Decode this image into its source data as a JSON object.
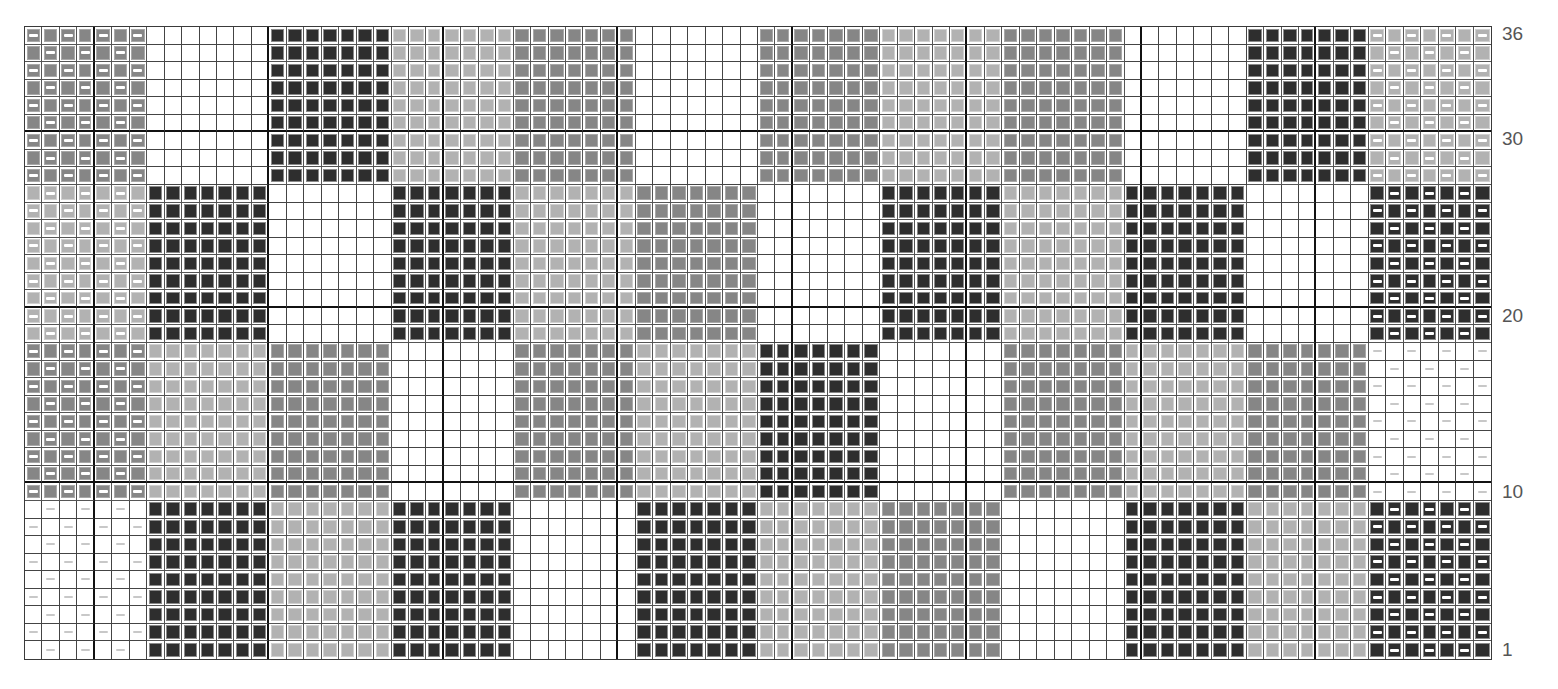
{
  "chart_title": "Knitting colorwork chart",
  "legend": {
    "W": {
      "name": "white",
      "color": "#ffffff"
    },
    "L": {
      "name": "light-gray",
      "color": "#b2b2b2"
    },
    "M": {
      "name": "medium-gray",
      "color": "#868686"
    },
    "D": {
      "name": "charcoal",
      "color": "#2e2e2e"
    },
    "purl_symbol": "white horizontal dash = purl stitch"
  },
  "grid": {
    "columns": 84,
    "rows": 36,
    "block_width_stitches": 7,
    "block_height_rows": 9
  },
  "row_labels": [
    {
      "label": "36",
      "row": 36
    },
    {
      "label": "30",
      "row": 30
    },
    {
      "label": "20",
      "row": 20
    },
    {
      "label": "10",
      "row": 10
    },
    {
      "label": "1",
      "row": 1
    }
  ],
  "bands": [
    {
      "rows": "28-36",
      "blocks": [
        "M*",
        "W",
        "D",
        "L",
        "M",
        "W",
        "M",
        "L",
        "M",
        "W",
        "D",
        "L*"
      ]
    },
    {
      "rows": "19-27",
      "blocks": [
        "L*",
        "D",
        "W",
        "D",
        "L",
        "M",
        "W",
        "D",
        "L",
        "D",
        "W",
        "D*"
      ]
    },
    {
      "rows": "10-18",
      "blocks": [
        "M*",
        "L",
        "M",
        "W",
        "M",
        "L",
        "D",
        "W",
        "M",
        "L",
        "M",
        "W*"
      ]
    },
    {
      "rows": "1-9",
      "blocks": [
        "W*",
        "D",
        "L",
        "D",
        "W",
        "D",
        "L",
        "M",
        "W",
        "D",
        "L",
        "D*"
      ]
    }
  ],
  "chart_data": {
    "type": "heatmap",
    "title": "",
    "xlabel": "",
    "ylabel": "Row",
    "y_ticks": [
      "1",
      "10",
      "20",
      "30",
      "36"
    ],
    "note": "Blocks marked * carry seed-stitch purl dashes on alternating stitches"
  }
}
